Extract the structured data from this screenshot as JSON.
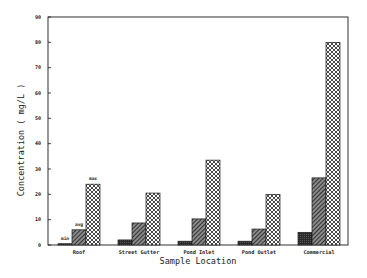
{
  "chart_data": {
    "type": "bar",
    "title": "",
    "xlabel": "Sample Location",
    "ylabel": "Concentration ( mg/L )",
    "ylim": [
      0,
      90
    ],
    "yticks": [
      0,
      10,
      20,
      30,
      40,
      50,
      60,
      70,
      80,
      90
    ],
    "grid": false,
    "legend": "inline annotations over first group (min, avg, max)",
    "categories": [
      "Roof",
      "Street Gutter",
      "Pond Inlet",
      "Pond Outlet",
      "Commercial"
    ],
    "series": [
      {
        "name": "min",
        "pattern": "solid-dark",
        "values": [
          0.5,
          2,
          1.5,
          1.5,
          5
        ]
      },
      {
        "name": "avg",
        "pattern": "diagonal-hatch",
        "values": [
          6,
          8.7,
          10.3,
          6.3,
          26.5
        ]
      },
      {
        "name": "max",
        "pattern": "crosshatch",
        "values": [
          24,
          20.5,
          33.5,
          20,
          80
        ]
      }
    ],
    "annotations": [
      {
        "text": "min",
        "category": "Roof",
        "series": "min"
      },
      {
        "text": "avg",
        "category": "Roof",
        "series": "avg"
      },
      {
        "text": "max",
        "category": "Roof",
        "series": "max"
      }
    ]
  },
  "colors": {
    "ink": "#1a1a1a",
    "min_fill": "#2a2a2a",
    "avg_fill": "#555555",
    "max_fill": "#ffffff"
  }
}
